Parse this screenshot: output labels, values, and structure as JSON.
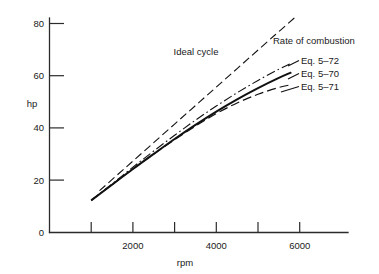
{
  "chart_data": {
    "type": "line",
    "title": "",
    "xlabel": "rpm",
    "ylabel": "hp",
    "xlim": [
      0,
      6600
    ],
    "ylim": [
      0,
      84
    ],
    "grid": false,
    "legend_position": "inline-right-annotations",
    "x_ticks": [
      1000,
      2000,
      3000,
      4000,
      5000,
      6000
    ],
    "x_tick_labels": [
      "",
      "2000",
      "",
      "4000",
      "",
      "6000"
    ],
    "y_ticks": [
      0,
      20,
      40,
      60,
      80
    ],
    "y_tick_labels": [
      "0",
      "20",
      "40",
      "60",
      "80"
    ],
    "series": [
      {
        "name": "Ideal cycle",
        "style": "dashed",
        "x": [
          1200,
          1800,
          2400,
          3000,
          3600,
          4200,
          4800,
          5400,
          5900
        ],
        "y": [
          16.0,
          24.5,
          33.0,
          41.5,
          50.0,
          58.5,
          67.0,
          75.5,
          82.5
        ]
      },
      {
        "name": "Eq. 5-72",
        "style": "dash-dot",
        "x": [
          1000,
          1500,
          2000,
          2500,
          3000,
          3500,
          4000,
          4500,
          5000,
          5500,
          5800
        ],
        "y": [
          12.3,
          18.6,
          25.0,
          31.2,
          37.2,
          43.0,
          48.4,
          53.5,
          58.2,
          62.5,
          64.8
        ]
      },
      {
        "name": "Eq. 5-70",
        "style": "solid",
        "x": [
          1000,
          1500,
          2000,
          2500,
          3000,
          3500,
          4000,
          4500,
          5000,
          5500,
          5800
        ],
        "y": [
          12.3,
          18.3,
          24.3,
          30.1,
          35.8,
          41.2,
          46.3,
          51.0,
          55.3,
          59.2,
          61.3
        ]
      },
      {
        "name": "Eq. 5-71",
        "style": "long-dash",
        "x": [
          1000,
          1500,
          2000,
          2500,
          3000,
          3500,
          4000,
          4500,
          5000,
          5500,
          5800
        ],
        "y": [
          12.3,
          18.3,
          24.3,
          30.0,
          35.5,
          40.7,
          45.5,
          49.6,
          52.9,
          55.5,
          56.6
        ]
      }
    ],
    "annotations": [
      {
        "text": "Ideal cycle",
        "x_px": 196,
        "y_px": 55
      },
      {
        "text": "Rate of combustion",
        "x_px": 276,
        "y_px": 44
      },
      {
        "text": "Eq. 5–72",
        "x_px": 301,
        "y_px": 63
      },
      {
        "text": "Eq. 5–70",
        "x_px": 301,
        "y_px": 76
      },
      {
        "text": "Eq. 5–71",
        "x_px": 301,
        "y_px": 89
      }
    ]
  },
  "labels": {
    "y_axis_title": "hp",
    "x_axis_title": "rpm",
    "y_80": "80",
    "y_60": "60",
    "y_40": "40",
    "y_20": "20",
    "y_0": "0",
    "x_2000": "2000",
    "x_4000": "4000",
    "x_6000": "6000",
    "annot_ideal_cycle": "Ideal cycle",
    "annot_rate_of_combustion": "Rate of combustion",
    "annot_eq_5_72": "Eq. 5–72",
    "annot_eq_5_70": "Eq. 5–70",
    "annot_eq_5_71": "Eq. 5–71"
  },
  "colors": {
    "ink": "#111111",
    "axis": "#2b2b2b",
    "background": "#ffffff"
  }
}
